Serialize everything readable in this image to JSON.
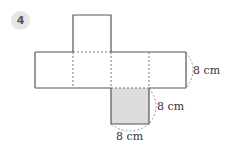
{
  "problem": {
    "number": "4"
  },
  "figure": {
    "type": "cube-net",
    "labels": {
      "right_edge": "8 cm",
      "shaded_right": "8 cm",
      "shaded_bottom": "8 cm"
    },
    "colors": {
      "line": "#555555",
      "shade": "#dcdcdc",
      "fold": "#777777"
    }
  }
}
